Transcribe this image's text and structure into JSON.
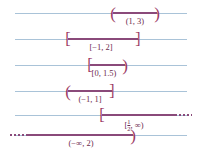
{
  "figure": {
    "colors": {
      "axis": "#a9c3d8",
      "interval": "#8a4a7a",
      "bracket": "#9c3a63",
      "label": "#6d2b4e",
      "background": "#ffffff"
    },
    "rows": [
      {
        "id": "row-open-1-3",
        "label": "(1, 3)",
        "left_endpoint": "1",
        "right_endpoint": "3",
        "left_bracket": "(",
        "right_bracket": ")",
        "left_closed": false,
        "right_closed": false,
        "left_infinite": false,
        "right_infinite": false
      },
      {
        "id": "row-closed-neg1-2",
        "label": "[−1, 2]",
        "left_endpoint": "−1",
        "right_endpoint": "2",
        "left_bracket": "[",
        "right_bracket": "]",
        "left_closed": true,
        "right_closed": true,
        "left_infinite": false,
        "right_infinite": false
      },
      {
        "id": "row-halfopen-0-1p5",
        "label": "[0, 1.5)",
        "left_endpoint": "0",
        "right_endpoint": "1.5",
        "left_bracket": "[",
        "right_bracket": ")",
        "left_closed": true,
        "right_closed": false,
        "left_infinite": false,
        "right_infinite": false
      },
      {
        "id": "row-halfopen-neg1-1",
        "label": "(−1, 1]",
        "left_endpoint": "−1",
        "right_endpoint": "1",
        "left_bracket": "(",
        "right_bracket": "]",
        "left_closed": false,
        "right_closed": true,
        "left_infinite": false,
        "right_infinite": false
      },
      {
        "id": "row-ray-half-infinity",
        "label_prefix": "[",
        "label_numerator": "1",
        "label_denominator": "2",
        "label_suffix": ", ∞)",
        "label": "[1/2, ∞)",
        "left_endpoint": "1/2",
        "right_endpoint": "∞",
        "left_bracket": "[",
        "right_bracket": ")",
        "left_closed": true,
        "right_closed": false,
        "left_infinite": false,
        "right_infinite": true
      },
      {
        "id": "row-ray-neginfinity-2",
        "label": "(−∞, 2)",
        "left_endpoint": "−∞",
        "right_endpoint": "2",
        "left_bracket": "(",
        "right_bracket": ")",
        "left_closed": false,
        "right_closed": false,
        "left_infinite": true,
        "right_infinite": false
      }
    ]
  }
}
